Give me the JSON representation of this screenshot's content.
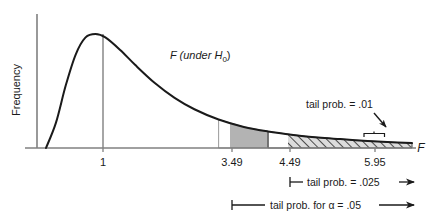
{
  "chart_data": {
    "type": "area",
    "title": "",
    "subtitle": "",
    "xlabel": "F",
    "ylabel": "Frequency",
    "grid": false,
    "legend_position": "none",
    "curve_label": "F (under H",
    "curve_label_sub": "0",
    "curve_label_end": ")",
    "xlim": [
      0,
      7.6
    ],
    "ylim": [
      0,
      1.05
    ],
    "x_ticks": [
      "1",
      "3.49",
      "4.49",
      "5.95"
    ],
    "x_tick_values": [
      1,
      3.49,
      4.49,
      5.95
    ],
    "mode_x": 1,
    "regions": [
      {
        "name": "shaded-gray-region",
        "fill": "gray",
        "from": 3.49,
        "to": 4.49,
        "probability": 0.025
      },
      {
        "name": "hatched-region",
        "fill": "diagonal-hatch",
        "from": 4.49,
        "to": 7.4,
        "probability": 0.01
      }
    ],
    "curve_points_x": [
      0.0,
      0.2,
      0.4,
      0.6,
      0.8,
      1.0,
      1.2,
      1.5,
      1.8,
      2.2,
      2.6,
      3.0,
      3.49,
      4.0,
      4.49,
      5.0,
      5.5,
      5.95,
      6.5,
      7.0,
      7.4
    ],
    "curve_points_y": [
      0.0,
      0.22,
      0.55,
      0.82,
      0.97,
      1.0,
      0.97,
      0.86,
      0.73,
      0.57,
      0.44,
      0.34,
      0.25,
      0.185,
      0.145,
      0.115,
      0.092,
      0.078,
      0.062,
      0.05,
      0.043
    ],
    "annotations": [
      {
        "name": "tail-prob-01",
        "text": "tail prob. = .01",
        "points_to": 5.95,
        "marker": "brace"
      },
      {
        "name": "tail-prob-025",
        "text": "tail prob. = .025",
        "from": 4.49,
        "marker": "arrow-right"
      },
      {
        "name": "tail-prob-alpha-05",
        "text_pre": "tail prob. for ",
        "alpha": "α",
        "text_post": " = .05",
        "text": "tail prob. for α = .05",
        "from": 3.49,
        "marker": "arrow-right"
      }
    ]
  },
  "colors": {
    "curve": "#1a1a1a",
    "axis": "#808080",
    "shaded_fill": "#b3b3b3",
    "hatch_stroke": "#1a1a1a",
    "hatch_bg": "#d9d9d9",
    "text": "#1a1a1a",
    "background": "#ffffff"
  }
}
